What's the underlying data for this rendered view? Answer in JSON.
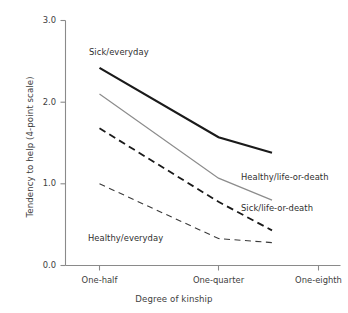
{
  "chart_data": {
    "type": "line",
    "title": "",
    "xlabel": "Degree of kinship",
    "ylabel": "Tendency to help (4-point scale)",
    "categories": [
      "One-half",
      "One-quarter",
      "One-eighth"
    ],
    "yticks": [
      "0.0",
      "1.0",
      "2.0",
      "3.0"
    ],
    "ylim": [
      0.0,
      3.0
    ],
    "grid": false,
    "legend_position": "inline-annotations",
    "series": [
      {
        "name": "Sick/everyday",
        "values": [
          2.42,
          1.57,
          1.38
        ],
        "style": "solid",
        "color": "#1a1a1a",
        "width": 2.2
      },
      {
        "name": "Healthy/life-or-death",
        "values": [
          2.1,
          1.07,
          0.8
        ],
        "style": "solid",
        "color": "#8c8c8c",
        "width": 1.2
      },
      {
        "name": "Sick/life-or-death",
        "values": [
          1.68,
          0.78,
          0.43
        ],
        "style": "dashed",
        "color": "#1a1a1a",
        "width": 1.8
      },
      {
        "name": "Healthy/everyday",
        "values": [
          1.0,
          0.33,
          0.28
        ],
        "style": "dashed",
        "color": "#3a3a3a",
        "width": 1.1
      }
    ]
  },
  "axes": {
    "y_title": "Tendency to help (4-point scale)",
    "x_title": "Degree of kinship",
    "y_tick_0": "0.0",
    "y_tick_1": "1.0",
    "y_tick_2": "2.0",
    "y_tick_3": "3.0",
    "x_tick_0": "One-half",
    "x_tick_1": "One-quarter",
    "x_tick_2": "One-eighth"
  },
  "annotations": {
    "sick_everyday": "Sick/everyday",
    "healthy_life_or_death": "Healthy/life-or-death",
    "sick_life_or_death": "Sick/life-or-death",
    "healthy_everyday": "Healthy/everyday"
  }
}
